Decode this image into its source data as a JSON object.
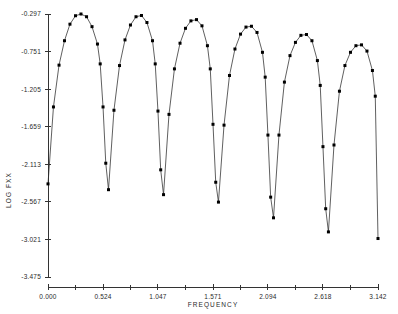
{
  "chart_data": {
    "type": "line",
    "title": "",
    "xlabel": "FREQUENCY",
    "ylabel": "LOG FXX",
    "xlim": [
      0.0,
      3.142
    ],
    "ylim": [
      -3.475,
      -0.297
    ],
    "grid": false,
    "legend": "none",
    "marker": "filled-square",
    "xticks": [
      0.0,
      0.524,
      1.047,
      1.571,
      2.094,
      2.618,
      3.142
    ],
    "xtick_labels": [
      "0.000",
      "0.524",
      "1.047",
      "1.571",
      "2.094",
      "2.618",
      "3.142"
    ],
    "xminor_ticks": [
      0.262,
      0.786,
      1.309,
      1.833,
      2.356,
      2.88
    ],
    "yticks": [
      -0.297,
      -0.751,
      -1.205,
      -1.659,
      -2.113,
      -2.567,
      -3.021,
      -3.475
    ],
    "ytick_labels": [
      "-0.297",
      "-0.751",
      "-1.205",
      "-1.659",
      "-2.113",
      "-2.567",
      "-3.021",
      "-3.475"
    ],
    "series": [
      {
        "name": "LOG FXX",
        "x": [
          0.0,
          0.052,
          0.105,
          0.157,
          0.209,
          0.262,
          0.314,
          0.367,
          0.419,
          0.471,
          0.497,
          0.524,
          0.55,
          0.576,
          0.628,
          0.681,
          0.733,
          0.785,
          0.838,
          0.89,
          0.942,
          0.995,
          1.021,
          1.047,
          1.073,
          1.1,
          1.152,
          1.204,
          1.257,
          1.309,
          1.361,
          1.414,
          1.466,
          1.518,
          1.545,
          1.571,
          1.597,
          1.623,
          1.676,
          1.728,
          1.78,
          1.833,
          1.885,
          1.937,
          1.99,
          2.042,
          2.068,
          2.094,
          2.12,
          2.147,
          2.199,
          2.251,
          2.304,
          2.356,
          2.408,
          2.461,
          2.513,
          2.565,
          2.592,
          2.618,
          2.644,
          2.67,
          2.723,
          2.775,
          2.827,
          2.88,
          2.932,
          2.985,
          3.037,
          3.089,
          3.116,
          3.142
        ],
        "y": [
          -2.35,
          -1.42,
          -0.915,
          -0.62,
          -0.42,
          -0.318,
          -0.297,
          -0.33,
          -0.45,
          -0.66,
          -0.9,
          -1.42,
          -2.1,
          -2.42,
          -1.46,
          -0.92,
          -0.61,
          -0.43,
          -0.33,
          -0.315,
          -0.4,
          -0.62,
          -0.9,
          -1.47,
          -2.18,
          -2.48,
          -1.51,
          -0.96,
          -0.65,
          -0.47,
          -0.38,
          -0.365,
          -0.44,
          -0.68,
          -0.96,
          -1.63,
          -2.33,
          -2.57,
          -1.64,
          -1.04,
          -0.72,
          -0.54,
          -0.455,
          -0.445,
          -0.52,
          -0.76,
          -1.06,
          -1.76,
          -2.51,
          -2.76,
          -1.76,
          -1.12,
          -0.8,
          -0.64,
          -0.555,
          -0.545,
          -0.62,
          -0.86,
          -1.16,
          -1.9,
          -2.65,
          -2.93,
          -1.88,
          -1.23,
          -0.92,
          -0.76,
          -0.68,
          -0.67,
          -0.745,
          -0.98,
          -1.29,
          -3.01
        ]
      }
    ]
  }
}
